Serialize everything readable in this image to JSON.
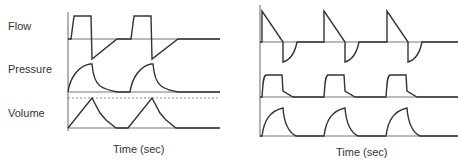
{
  "panels": [
    {
      "id": "left",
      "row_labels": [
        "Flow",
        "Pressure",
        "Volume"
      ],
      "x_axis_label": "Time (sec)",
      "has_dashed_reference_line": true,
      "waveforms": {
        "flow": "square-wave inspiratory flow with linear-ramp expiratory return",
        "pressure": "rounded rise, exponential decay",
        "volume": "linear ramp to peak, decay to baseline"
      },
      "cycles": 2
    },
    {
      "id": "right",
      "row_labels": [],
      "x_axis_label": "Time (sec)",
      "has_dashed_reference_line": false,
      "waveforms": {
        "flow": "decelerating ramp flow with curved expiratory return",
        "pressure": "square pressure plateau",
        "volume": "rounded rise, exponential decay"
      },
      "cycles": 3
    }
  ],
  "colors": {
    "trace": "#333333",
    "baseline": "#666666",
    "background": "#ffffff"
  }
}
